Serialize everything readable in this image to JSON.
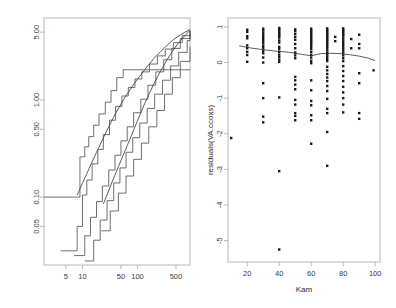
{
  "figure": {
    "background": "#ffffff",
    "frame_color": "#b9b9b9",
    "ink_color": "#4a4a4a",
    "point_color": "#1a1a1a"
  },
  "chart_data": [
    {
      "id": "left",
      "type": "line",
      "title": "",
      "xlabel": "",
      "ylabel": "",
      "xscale": "log",
      "yscale": "log",
      "grid": false,
      "legend": "none",
      "xticks": [
        5,
        10,
        50,
        100,
        500
      ],
      "xtick_labels": [
        "5",
        "10",
        "50",
        "100",
        "500"
      ],
      "yticks": [
        0.05,
        0.1,
        0.5,
        1.0,
        5.0
      ],
      "ytick_labels": [
        "0.05",
        "0.10",
        "0.50",
        "1.00",
        "5.00"
      ],
      "xlim": [
        2,
        900
      ],
      "ylim": [
        0.02,
        7.0
      ],
      "description": "Five monotone step functions (survival / cumulative-hazard style curves) rising left-to-right on log-log axes, plus two smooth diagonal curves converging near the top right.",
      "series": [
        {
          "name": "step-band-upper",
          "kind": "step",
          "x": [
            2,
            8,
            9,
            11,
            13,
            16,
            20,
            26,
            33,
            42,
            55,
            70,
            95,
            130,
            180,
            260,
            380,
            560,
            900
          ],
          "y": [
            0.1,
            0.1,
            0.26,
            0.33,
            0.42,
            0.55,
            0.72,
            0.95,
            1.25,
            1.7,
            2.05,
            2.05,
            2.05,
            2.05,
            2.05,
            2.05,
            2.05,
            2.05,
            2.05
          ]
        },
        {
          "name": "step-2",
          "kind": "step",
          "x": [
            4,
            8,
            10,
            12,
            15,
            19,
            24,
            31,
            40,
            52,
            68,
            90,
            120,
            165,
            230,
            320,
            450,
            650,
            900
          ],
          "y": [
            0.028,
            0.05,
            0.105,
            0.15,
            0.22,
            0.31,
            0.44,
            0.62,
            0.86,
            1.1,
            1.35,
            1.65,
            1.95,
            2.35,
            2.85,
            3.35,
            3.9,
            4.6,
            5.2
          ]
        },
        {
          "name": "step-3",
          "kind": "step",
          "x": [
            7,
            11,
            14,
            18,
            23,
            30,
            39,
            50,
            65,
            85,
            115,
            155,
            215,
            300,
            420,
            600,
            900
          ],
          "y": [
            0.025,
            0.04,
            0.062,
            0.09,
            0.13,
            0.19,
            0.27,
            0.38,
            0.53,
            0.74,
            1.02,
            1.42,
            1.95,
            2.6,
            3.4,
            4.3,
            5.2
          ]
        },
        {
          "name": "step-4",
          "kind": "step",
          "x": [
            11,
            16,
            21,
            28,
            37,
            48,
            62,
            82,
            110,
            150,
            205,
            285,
            400,
            560,
            800,
            900
          ],
          "y": [
            0.022,
            0.036,
            0.058,
            0.092,
            0.14,
            0.2,
            0.29,
            0.41,
            0.58,
            0.82,
            1.15,
            1.6,
            2.25,
            3.1,
            4.1,
            4.8
          ]
        },
        {
          "name": "step-band-lower",
          "kind": "step",
          "x": [
            22,
            32,
            45,
            62,
            85,
            118,
            160,
            225,
            310,
            430,
            600,
            900
          ],
          "y": [
            0.045,
            0.072,
            0.11,
            0.165,
            0.245,
            0.36,
            0.53,
            0.78,
            1.15,
            1.7,
            2.5,
            3.55
          ]
        },
        {
          "name": "smooth-fit-a",
          "kind": "curve",
          "x": [
            8,
            12,
            18,
            27,
            40,
            60,
            90,
            135,
            200,
            300,
            450,
            700,
            900
          ],
          "y": [
            0.105,
            0.175,
            0.29,
            0.47,
            0.73,
            1.08,
            1.52,
            2.05,
            2.7,
            3.4,
            4.2,
            4.95,
            5.3
          ]
        },
        {
          "name": "smooth-fit-b",
          "kind": "curve",
          "x": [
            24,
            34,
            48,
            68,
            96,
            135,
            190,
            270,
            380,
            540,
            760,
            900
          ],
          "y": [
            0.085,
            0.14,
            0.225,
            0.36,
            0.58,
            0.92,
            1.4,
            2.05,
            2.85,
            3.8,
            4.75,
            5.2
          ]
        }
      ]
    },
    {
      "id": "right",
      "type": "scatter",
      "title": "",
      "xlabel": "Kam",
      "ylabel": "residuals(VA.ccoxs)",
      "xscale": "linear",
      "yscale": "linear",
      "grid": false,
      "legend": "none",
      "xticks": [
        20,
        40,
        60,
        80,
        100
      ],
      "xtick_labels": [
        "20",
        "40",
        "60",
        "80",
        "100"
      ],
      "yticks": [
        1,
        0,
        -1,
        -2,
        -3,
        -4,
        -5
      ],
      "ytick_labels": [
        "1",
        "0",
        "-1",
        "-2",
        "-3",
        "-4",
        "-5"
      ],
      "xlim": [
        8,
        103
      ],
      "ylim": [
        -5.6,
        1.25
      ],
      "description": "Martingale-residual scatter against Karnofsky score with a lowess smoother that drifts slightly downward from about 0.45 at x=15 to about 0.05 at x=100.",
      "smoother": {
        "name": "lowess",
        "x": [
          15,
          22,
          30,
          38,
          46,
          54,
          60,
          66,
          72,
          78,
          84,
          90,
          96,
          100
        ],
        "y": [
          0.47,
          0.41,
          0.36,
          0.32,
          0.29,
          0.23,
          0.19,
          0.25,
          0.26,
          0.25,
          0.22,
          0.18,
          0.12,
          0.05
        ]
      },
      "points": [
        [
          10,
          -2.12
        ],
        [
          20,
          0.92
        ],
        [
          20,
          0.86
        ],
        [
          20,
          0.74
        ],
        [
          20,
          0.68
        ],
        [
          20,
          0.48
        ],
        [
          20,
          0.4
        ],
        [
          20,
          0.3
        ],
        [
          20,
          0.21
        ],
        [
          20,
          0.02
        ],
        [
          30,
          0.95
        ],
        [
          30,
          0.9
        ],
        [
          30,
          0.84
        ],
        [
          30,
          0.78
        ],
        [
          30,
          0.72
        ],
        [
          30,
          0.66
        ],
        [
          30,
          0.6
        ],
        [
          30,
          0.54
        ],
        [
          30,
          0.47
        ],
        [
          30,
          0.41
        ],
        [
          30,
          0.33
        ],
        [
          30,
          0.26
        ],
        [
          30,
          0.14
        ],
        [
          30,
          0.0
        ],
        [
          30,
          -0.58
        ],
        [
          30,
          -1.0
        ],
        [
          30,
          -1.52
        ],
        [
          30,
          -1.68
        ],
        [
          40,
          0.97
        ],
        [
          40,
          0.94
        ],
        [
          40,
          0.9
        ],
        [
          40,
          0.86
        ],
        [
          40,
          0.82
        ],
        [
          40,
          0.78
        ],
        [
          40,
          0.74
        ],
        [
          40,
          0.7
        ],
        [
          40,
          0.62
        ],
        [
          40,
          0.56
        ],
        [
          40,
          0.44
        ],
        [
          40,
          0.38
        ],
        [
          40,
          0.3
        ],
        [
          40,
          0.22
        ],
        [
          40,
          0.15
        ],
        [
          40,
          0.08
        ],
        [
          40,
          0.02
        ],
        [
          40,
          -0.98
        ],
        [
          40,
          -3.05
        ],
        [
          40,
          -5.25
        ],
        [
          50,
          0.93
        ],
        [
          50,
          0.88
        ],
        [
          50,
          0.8
        ],
        [
          50,
          0.72
        ],
        [
          50,
          0.64
        ],
        [
          50,
          0.52
        ],
        [
          50,
          0.4
        ],
        [
          50,
          0.28
        ],
        [
          50,
          0.2
        ],
        [
          50,
          0.12
        ],
        [
          50,
          -0.4
        ],
        [
          50,
          -0.5
        ],
        [
          50,
          -0.62
        ],
        [
          50,
          -0.75
        ],
        [
          50,
          -1.05
        ],
        [
          50,
          -1.18
        ],
        [
          50,
          -1.42
        ],
        [
          50,
          -1.5
        ],
        [
          50,
          -1.62
        ],
        [
          60,
          0.95
        ],
        [
          60,
          0.9
        ],
        [
          60,
          0.85
        ],
        [
          60,
          0.8
        ],
        [
          60,
          0.75
        ],
        [
          60,
          0.7
        ],
        [
          60,
          0.65
        ],
        [
          60,
          0.6
        ],
        [
          60,
          0.55
        ],
        [
          60,
          0.5
        ],
        [
          60,
          0.44
        ],
        [
          60,
          0.38
        ],
        [
          60,
          0.3
        ],
        [
          60,
          0.22
        ],
        [
          60,
          0.14
        ],
        [
          60,
          0.05
        ],
        [
          60,
          -0.02
        ],
        [
          60,
          -0.5
        ],
        [
          60,
          -0.78
        ],
        [
          60,
          -1.08
        ],
        [
          60,
          -1.2
        ],
        [
          60,
          -1.48
        ],
        [
          60,
          -1.62
        ],
        [
          60,
          -2.28
        ],
        [
          70,
          0.96
        ],
        [
          70,
          0.92
        ],
        [
          70,
          0.88
        ],
        [
          70,
          0.84
        ],
        [
          70,
          0.8
        ],
        [
          70,
          0.76
        ],
        [
          70,
          0.72
        ],
        [
          70,
          0.68
        ],
        [
          70,
          0.64
        ],
        [
          70,
          0.6
        ],
        [
          70,
          0.55
        ],
        [
          70,
          0.5
        ],
        [
          70,
          0.45
        ],
        [
          70,
          0.4
        ],
        [
          70,
          0.34
        ],
        [
          70,
          0.28
        ],
        [
          70,
          0.22
        ],
        [
          70,
          0.16
        ],
        [
          70,
          0.1
        ],
        [
          70,
          0.04
        ],
        [
          70,
          -0.12
        ],
        [
          70,
          -0.22
        ],
        [
          70,
          -0.32
        ],
        [
          70,
          -0.42
        ],
        [
          70,
          -0.52
        ],
        [
          70,
          -0.66
        ],
        [
          70,
          -0.8
        ],
        [
          70,
          -1.02
        ],
        [
          70,
          -1.3
        ],
        [
          70,
          -1.42
        ],
        [
          70,
          -1.95
        ],
        [
          70,
          -2.9
        ],
        [
          75,
          0.72
        ],
        [
          75,
          0.6
        ],
        [
          80,
          0.96
        ],
        [
          80,
          0.92
        ],
        [
          80,
          0.88
        ],
        [
          80,
          0.84
        ],
        [
          80,
          0.8
        ],
        [
          80,
          0.76
        ],
        [
          80,
          0.7
        ],
        [
          80,
          0.64
        ],
        [
          80,
          0.58
        ],
        [
          80,
          0.52
        ],
        [
          80,
          0.46
        ],
        [
          80,
          0.4
        ],
        [
          80,
          0.34
        ],
        [
          80,
          0.28
        ],
        [
          80,
          0.2
        ],
        [
          80,
          0.12
        ],
        [
          80,
          0.04
        ],
        [
          80,
          -0.1
        ],
        [
          80,
          -0.24
        ],
        [
          80,
          -0.38
        ],
        [
          80,
          -0.52
        ],
        [
          80,
          -0.68
        ],
        [
          80,
          -0.84
        ],
        [
          80,
          -1.0
        ],
        [
          80,
          -1.18
        ],
        [
          80,
          -1.4
        ],
        [
          85,
          0.66
        ],
        [
          85,
          0.4
        ],
        [
          90,
          0.78
        ],
        [
          90,
          0.52
        ],
        [
          90,
          0.4
        ],
        [
          90,
          -0.3
        ],
        [
          90,
          -0.58
        ],
        [
          90,
          -1.42
        ],
        [
          90,
          -1.58
        ],
        [
          99,
          -0.22
        ]
      ]
    }
  ]
}
